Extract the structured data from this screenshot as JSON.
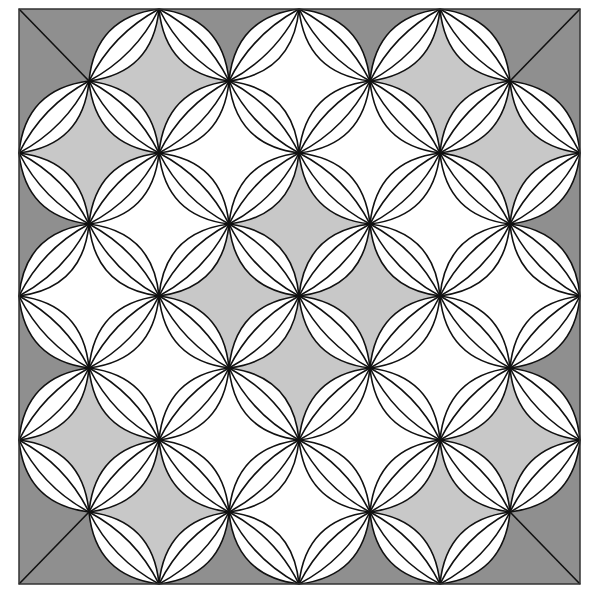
{
  "figure": {
    "title": "Orange peel quilt block pattern",
    "grid": {
      "x": [
        19,
        89,
        159,
        229,
        299,
        370,
        440,
        510,
        580
      ],
      "y": [
        9,
        81,
        153,
        224,
        296,
        368,
        440,
        512,
        584
      ]
    },
    "colors": {
      "dark": "#8f8f8f",
      "light": "#c8c8c8",
      "white": "#ffffff",
      "line": "#111111",
      "border": "#333333"
    },
    "cells": [
      {
        "i": 2,
        "j": 1,
        "fill": "light"
      },
      {
        "i": 4,
        "j": 1,
        "fill": "white"
      },
      {
        "i": 6,
        "j": 1,
        "fill": "light"
      },
      {
        "i": 1,
        "j": 2,
        "fill": "light"
      },
      {
        "i": 3,
        "j": 2,
        "fill": "white"
      },
      {
        "i": 5,
        "j": 2,
        "fill": "white"
      },
      {
        "i": 7,
        "j": 2,
        "fill": "light"
      },
      {
        "i": 2,
        "j": 3,
        "fill": "white"
      },
      {
        "i": 4,
        "j": 3,
        "fill": "light"
      },
      {
        "i": 6,
        "j": 3,
        "fill": "white"
      },
      {
        "i": 1,
        "j": 4,
        "fill": "white"
      },
      {
        "i": 3,
        "j": 4,
        "fill": "light"
      },
      {
        "i": 5,
        "j": 4,
        "fill": "light"
      },
      {
        "i": 7,
        "j": 4,
        "fill": "white"
      },
      {
        "i": 2,
        "j": 5,
        "fill": "white"
      },
      {
        "i": 4,
        "j": 5,
        "fill": "light"
      },
      {
        "i": 6,
        "j": 5,
        "fill": "white"
      },
      {
        "i": 1,
        "j": 6,
        "fill": "light"
      },
      {
        "i": 3,
        "j": 6,
        "fill": "white"
      },
      {
        "i": 5,
        "j": 6,
        "fill": "white"
      },
      {
        "i": 7,
        "j": 6,
        "fill": "light"
      },
      {
        "i": 2,
        "j": 7,
        "fill": "light"
      },
      {
        "i": 4,
        "j": 7,
        "fill": "white"
      },
      {
        "i": 6,
        "j": 7,
        "fill": "light"
      }
    ],
    "lens": {
      "outer_bulge": 0.2,
      "inner_bulge": 0.08
    }
  }
}
